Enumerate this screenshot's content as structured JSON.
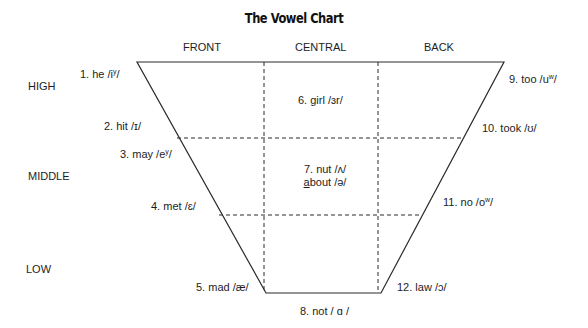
{
  "title": "The Vowel Chart",
  "columns": {
    "front": "FRONT",
    "central": "CENTRAL",
    "back": "BACK"
  },
  "rows": {
    "high": "HIGH",
    "middle": "MIDDLE",
    "low": "LOW"
  },
  "vowels": [
    {
      "num": "1.",
      "word": "he",
      "ipa_pre": "/i",
      "ipa_sup": "y",
      "ipa_post": "/",
      "position": "front-high"
    },
    {
      "num": "2.",
      "word": "hit",
      "ipa_pre": "/ɪ/",
      "ipa_sup": "",
      "ipa_post": "",
      "position": "front-high"
    },
    {
      "num": "3.",
      "word": "may",
      "ipa_pre": "/e",
      "ipa_sup": "y",
      "ipa_post": "/",
      "position": "front-middle"
    },
    {
      "num": "4.",
      "word": "met",
      "ipa_pre": "/ɛ/",
      "ipa_sup": "",
      "ipa_post": "",
      "position": "front-middle"
    },
    {
      "num": "5.",
      "word": "mad",
      "ipa_pre": "/æ/",
      "ipa_sup": "",
      "ipa_post": "",
      "position": "front-low"
    },
    {
      "num": "6.",
      "word": "girl",
      "ipa_pre": "/ɜr/",
      "ipa_sup": "",
      "ipa_post": "",
      "position": "central-high"
    },
    {
      "num": "7.",
      "word": "nut",
      "ipa_pre": "/ʌ/",
      "ipa_sup": "",
      "ipa_post": "",
      "position": "central-middle"
    },
    {
      "num": "",
      "word": "about",
      "underline": "a",
      "rest": "bout",
      "ipa_pre": "/ə/",
      "ipa_sup": "",
      "ipa_post": "",
      "position": "central-middle"
    },
    {
      "num": "8.",
      "word": "not",
      "ipa_pre": "/ ɑ /",
      "ipa_sup": "",
      "ipa_post": "",
      "position": "central-low"
    },
    {
      "num": "9.",
      "word": "too",
      "ipa_pre": "/u",
      "ipa_sup": "w",
      "ipa_post": "/",
      "position": "back-high"
    },
    {
      "num": "10.",
      "word": "took",
      "ipa_pre": "/ʊ/",
      "ipa_sup": "",
      "ipa_post": "",
      "position": "back-high"
    },
    {
      "num": "11.",
      "word": "no",
      "ipa_pre": "/o",
      "ipa_sup": "w",
      "ipa_post": "/",
      "position": "back-middle"
    },
    {
      "num": "12.",
      "word": "law",
      "ipa_pre": "/ɔ/",
      "ipa_sup": "",
      "ipa_post": "",
      "position": "back-low"
    }
  ],
  "geometry": {
    "top_left": [
      137,
      62
    ],
    "top_right": [
      504,
      62
    ],
    "bottom_right": [
      381,
      293
    ],
    "bottom_left": [
      266,
      293
    ],
    "dashed_vertical_x": [
      264,
      378
    ],
    "dashed_horizontal_y": [
      138,
      215
    ]
  }
}
